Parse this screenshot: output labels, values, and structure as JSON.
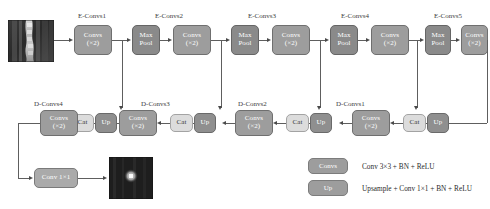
{
  "figure": {
    "type": "neural-network-architecture-diagram"
  },
  "encoder": {
    "captions": [
      "E-Convs1",
      "E-Convs2",
      "E-Convs3",
      "E-Convs4",
      "E-Convs5"
    ],
    "conv_block": {
      "line1": "Convs",
      "line2": "(×2)"
    },
    "pool_block": {
      "line1": "Max",
      "line2": "Pool"
    }
  },
  "decoder": {
    "captions": [
      "D-Convs4",
      "D-Convs3",
      "D-Convs2",
      "D-Convs1"
    ],
    "conv_block": {
      "line1": "Convs",
      "line2": "(×2)"
    },
    "cat_block": {
      "label": "Cat"
    },
    "up_block": {
      "label": "Up"
    }
  },
  "output_head": {
    "label": "Conv 1×1"
  },
  "images": {
    "input": {
      "name": "input-mri-slice"
    },
    "output": {
      "name": "output-segmentation-map"
    }
  },
  "legend": {
    "rows": [
      {
        "swatch": "Convs",
        "text": "Conv 3×3 + BN + ReLU"
      },
      {
        "swatch": "Up",
        "text": "Upsample + Conv 1×1 + BN + ReLU"
      }
    ]
  },
  "colors": {
    "conv": "#9d9d9d",
    "pool": "#8a8a8a",
    "up": "#8f8f8f",
    "cat": "#dcdcdc",
    "line": "#5e5e5e",
    "background": "#ffffff"
  }
}
